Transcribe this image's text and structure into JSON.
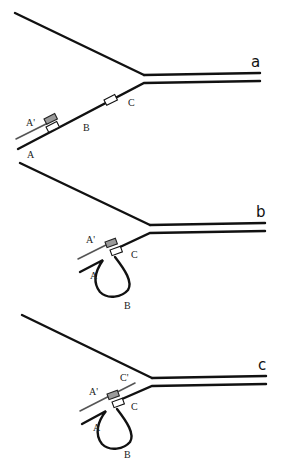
{
  "figure": {
    "panels": [
      {
        "id": "a",
        "label": "a",
        "segments": {
          "A": "A",
          "A_prime": "A'",
          "B": "B",
          "C": "C"
        }
      },
      {
        "id": "b",
        "label": "b",
        "segments": {
          "A": "A",
          "A_prime": "A'",
          "B": "B",
          "C": "C"
        }
      },
      {
        "id": "c",
        "label": "c",
        "segments": {
          "A": "A",
          "A_prime": "A'",
          "B": "B",
          "C": "C",
          "C_prime": "C'"
        }
      }
    ],
    "colors": {
      "strand": "#111111",
      "nascent_strand": "#555555",
      "shaded_box": "#9a9a9a",
      "background": "#ffffff"
    }
  }
}
